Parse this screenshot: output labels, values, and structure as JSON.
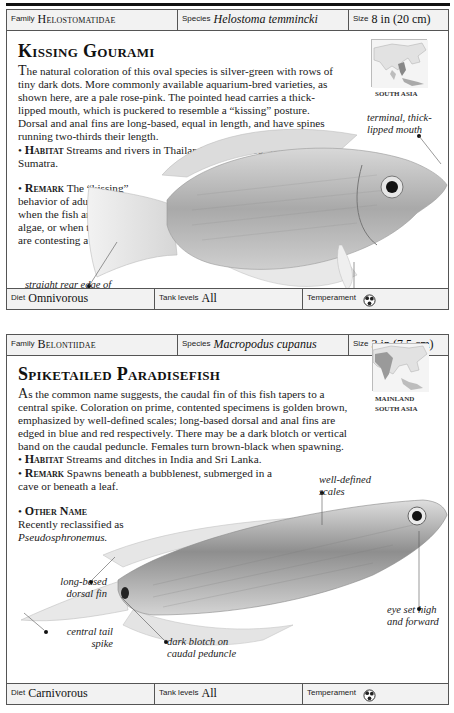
{
  "entries": [
    {
      "family_label": "Family",
      "family": "Helostomatidae",
      "species_label": "Species",
      "species": "Helostoma temmincki",
      "size_label": "Size",
      "size": "8 in (20 cm)",
      "title": "Kissing Gourami",
      "description_first": "T",
      "description": "he natural coloration of this oval species is silver-green with rows of tiny dark dots. More commonly available aquarium-bred varieties, as shown here, are a pale rose-pink. The pointed head carries a thick-lipped mouth, which is puckered to resemble a “kissing” posture. Dorsal and anal fins are long-based, equal in length, and have spines running two-thirds their length.",
      "bullets": [
        {
          "keyword": "Habitat",
          "text": "Streams and rivers in Thailand; also Borneo, Java, and Sumatra."
        },
        {
          "keyword": "Remark",
          "text": "The “kissing” behavior of adults occurs when the fish are grazing algae, or when two fish are contesting a territory."
        }
      ],
      "map_label": "SOUTH ASIA",
      "annotations": [
        {
          "id": "mouth",
          "text": "terminal, thick-lipped mouth"
        },
        {
          "id": "caudal",
          "text": "straight rear edge of caudal fin"
        },
        {
          "id": "fins",
          "text": "colorless fins"
        }
      ],
      "diet_label": "Diet",
      "diet": "Omnivorous",
      "tank_label": "Tank levels",
      "tank": "All",
      "temperament_label": "Temperament",
      "temperament_icon": "semi-aggressive-icon"
    },
    {
      "family_label": "Family",
      "family": "Belontiidae",
      "species_label": "Species",
      "species": "Macropodus cupanus",
      "size_label": "Size",
      "size": "3 in (7.5 cm)",
      "title": "Spiketailed Paradisefish",
      "description_first": "A",
      "description": "s the common name suggests, the caudal fin of this fish tapers to a central spike. Coloration on prime, contented specimens is golden brown, emphasized by well-defined scales; long-based dorsal and anal fins are edged in blue and red respectively. There may be a dark blotch or vertical band on the caudal peduncle. Females turn brown-black when spawning.",
      "bullets": [
        {
          "keyword": "Habitat",
          "text": "Streams and ditches in India and Sri Lanka."
        },
        {
          "keyword": "Remark",
          "text": "Spawns beneath a bubblenest, submerged in a cave or beneath a leaf."
        },
        {
          "keyword": "Other Name",
          "text": "Recently reclassified as",
          "italic": "Pseudosphronemus."
        }
      ],
      "map_label_1": "MAINLAND",
      "map_label_2": "SOUTH ASIA",
      "annotations": [
        {
          "id": "scales",
          "text": "well-defined scales"
        },
        {
          "id": "dorsal",
          "text": "long-based dorsal fin"
        },
        {
          "id": "eye",
          "text": "eye set high and forward"
        },
        {
          "id": "spike",
          "text": "central tail spike"
        },
        {
          "id": "blotch",
          "text": "dark blotch on caudal peduncle"
        }
      ],
      "diet_label": "Diet",
      "diet": "Carnivorous",
      "tank_label": "Tank levels",
      "tank": "All",
      "temperament_label": "Temperament",
      "temperament_icon": "semi-aggressive-icon"
    }
  ]
}
